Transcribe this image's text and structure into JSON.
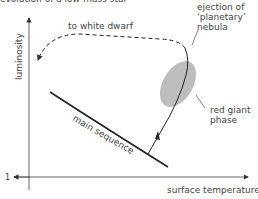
{
  "title": "evolution of a low-mass star",
  "axes": {
    "y_label": "luminosity",
    "x_label": "surface temperature",
    "y_origin_tick": "1"
  },
  "annotations": {
    "white_dwarf": "to white dwarf",
    "ejection_line1": "ejection of",
    "ejection_line2": "‘planetary’",
    "ejection_line3": "nebula",
    "red_giant_line1": "red giant",
    "red_giant_line2": "phase",
    "main_sequence": "main sequence"
  },
  "colors": {
    "line": "#222222",
    "axis": "#555555",
    "blob": "#bdbdbd",
    "text": "#444444"
  }
}
